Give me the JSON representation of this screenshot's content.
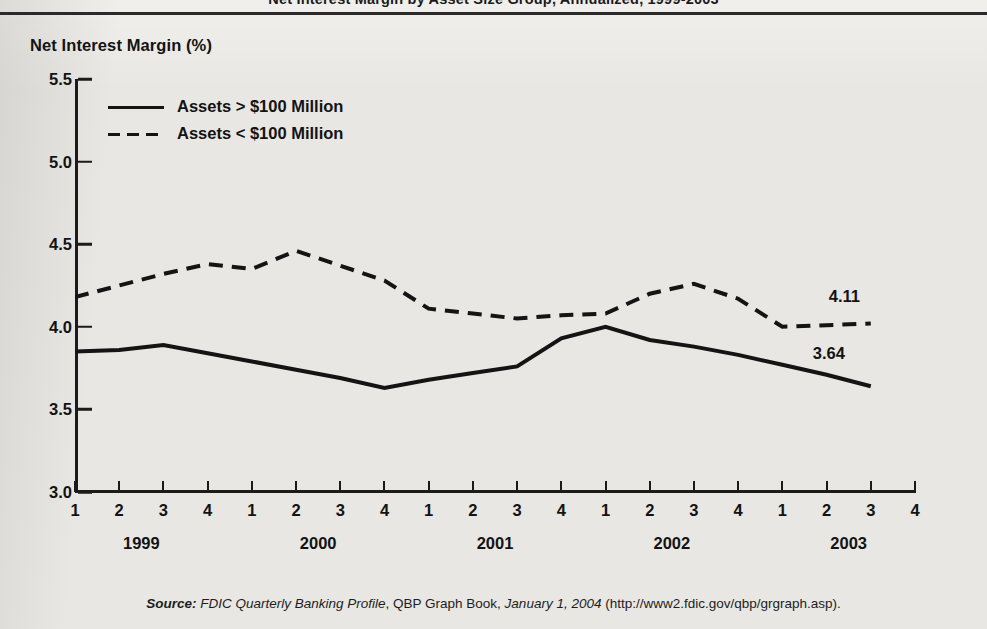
{
  "title": "Net Interest Margin by Asset Size Group, Annualized, 1999-2003",
  "axis_title": "Net Interest Margin (%)",
  "legend": [
    {
      "label": "Assets > $100 Million",
      "style": "solid"
    },
    {
      "label": "Assets < $100 Million",
      "style": "dashed"
    }
  ],
  "source": {
    "lead": "Source:",
    "pub": "FDIC Quarterly Banking Profile",
    "mid": ", QBP Graph Book, ",
    "date": "January 1, 2004",
    "url": " (http://www2.fdic.gov/qbp/grgraph.asp)."
  },
  "y_ticks": [
    "3.0",
    "3.5",
    "4.0",
    "4.5",
    "5.0",
    "5.5"
  ],
  "x_quarter_labels": [
    "1",
    "2",
    "3",
    "4",
    "1",
    "2",
    "3",
    "4",
    "1",
    "2",
    "3",
    "4",
    "1",
    "2",
    "3",
    "4",
    "1",
    "2",
    "3",
    "4"
  ],
  "years": [
    "1999",
    "2000",
    "2001",
    "2002",
    "2003"
  ],
  "end_labels": {
    "large": "3.64",
    "small": "4.11"
  },
  "colors": {
    "ink": "#141414",
    "background": "#e8e7e3"
  },
  "chart_data": {
    "type": "line",
    "title": "Net Interest Margin by Asset Size Group, Annualized, 1999-2003",
    "xlabel": "",
    "ylabel": "Net Interest Margin (%)",
    "ylim": [
      3.0,
      5.5
    ],
    "ytick_values": [
      3.0,
      3.5,
      4.0,
      4.5,
      5.0,
      5.5
    ],
    "grid": false,
    "legend_position": "upper-left",
    "x": [
      "1999Q1",
      "1999Q2",
      "1999Q3",
      "1999Q4",
      "2000Q1",
      "2000Q2",
      "2000Q3",
      "2000Q4",
      "2001Q1",
      "2001Q2",
      "2001Q3",
      "2001Q4",
      "2002Q1",
      "2002Q2",
      "2002Q3",
      "2002Q4",
      "2003Q1",
      "2003Q2",
      "2003Q3",
      "2003Q4"
    ],
    "categories": [
      "1",
      "2",
      "3",
      "4",
      "1",
      "2",
      "3",
      "4",
      "1",
      "2",
      "3",
      "4",
      "1",
      "2",
      "3",
      "4",
      "1",
      "2",
      "3",
      "4"
    ],
    "series": [
      {
        "name": "Assets > $100 Million",
        "style": "solid",
        "values": [
          3.85,
          3.86,
          3.89,
          3.84,
          3.79,
          3.74,
          3.69,
          3.63,
          3.68,
          3.72,
          3.76,
          3.93,
          4.0,
          3.92,
          3.88,
          3.83,
          3.77,
          3.71,
          3.64,
          null
        ],
        "end_label": "3.64"
      },
      {
        "name": "Assets < $100 Million",
        "style": "dashed",
        "values": [
          4.18,
          4.25,
          4.32,
          4.38,
          4.35,
          4.46,
          4.37,
          4.28,
          4.11,
          4.08,
          4.05,
          4.07,
          4.08,
          4.2,
          4.26,
          4.17,
          4.0,
          4.01,
          4.02,
          null
        ],
        "end_label": "4.11"
      }
    ],
    "annotations": [
      {
        "text": "4.11",
        "series": "Assets < $100 Million",
        "at": "2003Q3"
      },
      {
        "text": "3.64",
        "series": "Assets > $100 Million",
        "at": "2003Q3"
      }
    ]
  }
}
